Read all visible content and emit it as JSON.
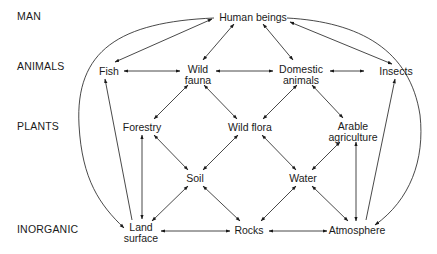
{
  "diagram": {
    "row_labels": [
      {
        "id": "man",
        "label": "MAN",
        "y": 16
      },
      {
        "id": "animals",
        "label": "ANIMALS",
        "y": 66
      },
      {
        "id": "plants",
        "label": "PLANTS",
        "y": 126
      },
      {
        "id": "inorganic",
        "label": "INORGANIC",
        "y": 229
      }
    ],
    "nodes": {
      "human_beings": {
        "line1": "Human beings",
        "line2": ""
      },
      "fish": {
        "line1": "Fish",
        "line2": ""
      },
      "wild_fauna": {
        "line1": "Wild",
        "line2": "fauna"
      },
      "domestic_animals": {
        "line1": "Domestic",
        "line2": "animals"
      },
      "insects": {
        "line1": "Insects",
        "line2": ""
      },
      "forestry": {
        "line1": "Forestry",
        "line2": ""
      },
      "wild_flora": {
        "line1": "Wild flora",
        "line2": ""
      },
      "arable_agriculture": {
        "line1": "Arable",
        "line2": "agriculture"
      },
      "soil": {
        "line1": "Soil",
        "line2": ""
      },
      "water": {
        "line1": "Water",
        "line2": ""
      },
      "land_surface": {
        "line1": "Land",
        "line2": "surface"
      },
      "rocks": {
        "line1": "Rocks",
        "line2": ""
      },
      "atmosphere": {
        "line1": "Atmosphere",
        "line2": ""
      }
    },
    "edges": [
      {
        "from": "human_beings",
        "to": "fish",
        "type": "bidirectional"
      },
      {
        "from": "human_beings",
        "to": "wild_fauna",
        "type": "bidirectional"
      },
      {
        "from": "human_beings",
        "to": "domestic_animals",
        "type": "bidirectional"
      },
      {
        "from": "human_beings",
        "to": "insects",
        "type": "bidirectional"
      },
      {
        "from": "human_beings",
        "to": "land_surface",
        "type": "curved"
      },
      {
        "from": "human_beings",
        "to": "atmosphere",
        "type": "curved"
      },
      {
        "from": "fish",
        "to": "wild_fauna",
        "type": "bidirectional"
      },
      {
        "from": "wild_fauna",
        "to": "domestic_animals",
        "type": "bidirectional"
      },
      {
        "from": "domestic_animals",
        "to": "insects",
        "type": "bidirectional"
      },
      {
        "from": "wild_fauna",
        "to": "forestry",
        "type": "bidirectional"
      },
      {
        "from": "wild_fauna",
        "to": "wild_flora",
        "type": "bidirectional"
      },
      {
        "from": "domestic_animals",
        "to": "wild_flora",
        "type": "bidirectional"
      },
      {
        "from": "domestic_animals",
        "to": "arable_agriculture",
        "type": "bidirectional"
      },
      {
        "from": "land_surface",
        "to": "fish",
        "type": "directed"
      },
      {
        "from": "insects",
        "to": "atmosphere",
        "type": "directed"
      },
      {
        "from": "forestry",
        "to": "soil",
        "type": "bidirectional"
      },
      {
        "from": "wild_flora",
        "to": "soil",
        "type": "bidirectional"
      },
      {
        "from": "wild_flora",
        "to": "water",
        "type": "bidirectional"
      },
      {
        "from": "arable_agriculture",
        "to": "water",
        "type": "bidirectional"
      },
      {
        "from": "forestry",
        "to": "land_surface",
        "type": "bidirectional"
      },
      {
        "from": "arable_agriculture",
        "to": "atmosphere",
        "type": "bidirectional"
      },
      {
        "from": "soil",
        "to": "land_surface",
        "type": "bidirectional"
      },
      {
        "from": "soil",
        "to": "rocks",
        "type": "bidirectional"
      },
      {
        "from": "water",
        "to": "rocks",
        "type": "bidirectional"
      },
      {
        "from": "water",
        "to": "atmosphere",
        "type": "bidirectional"
      },
      {
        "from": "land_surface",
        "to": "rocks",
        "type": "bidirectional"
      },
      {
        "from": "rocks",
        "to": "atmosphere",
        "type": "bidirectional"
      }
    ],
    "line_color": "#1a1a1a",
    "background_color": "#ffffff"
  }
}
